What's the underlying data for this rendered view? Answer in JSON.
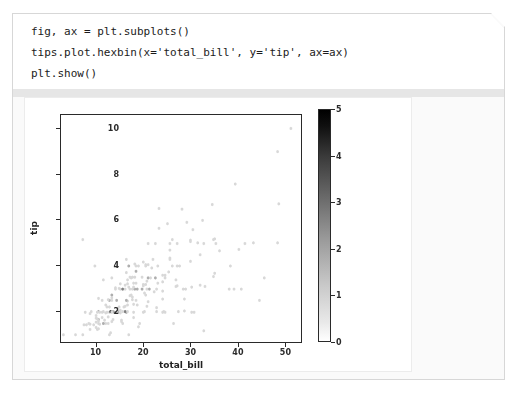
{
  "code_cell": {
    "lines": [
      "fig, ax = plt.subplots()",
      "tips.plot.hexbin(x='total_bill', y='tip', ax=ax)",
      "plt.show()"
    ]
  },
  "chart_data": {
    "type": "heatmap",
    "subtype": "hexbin",
    "title": "",
    "xlabel": "total_bill",
    "ylabel": "tip",
    "xlim": [
      2.5,
      53.5
    ],
    "ylim": [
      0.6,
      10.6
    ],
    "xticks": [
      10,
      20,
      30,
      40,
      50
    ],
    "yticks": [
      2,
      4,
      6,
      8,
      10
    ],
    "grid": false,
    "colormap": "viridis-gray-reversed",
    "colorbar": {
      "label": "",
      "min": 0,
      "max": 5,
      "ticks": [
        0,
        1,
        2,
        3,
        4,
        5
      ],
      "low_color": "#ffffff",
      "high_color": "#000000",
      "position": "right"
    },
    "gridsize": 100,
    "note": "counts per hexagonal bin of the seaborn tips dataset",
    "points": [
      [
        16.99,
        1.01
      ],
      [
        10.34,
        1.66
      ],
      [
        21.01,
        3.5
      ],
      [
        23.68,
        3.31
      ],
      [
        24.59,
        3.61
      ],
      [
        25.29,
        4.71
      ],
      [
        8.77,
        2.0
      ],
      [
        26.88,
        3.12
      ],
      [
        15.04,
        1.96
      ],
      [
        14.78,
        3.23
      ],
      [
        10.27,
        1.71
      ],
      [
        35.26,
        5.0
      ],
      [
        15.42,
        1.57
      ],
      [
        18.43,
        3.0
      ],
      [
        14.83,
        3.02
      ],
      [
        21.58,
        3.92
      ],
      [
        10.33,
        1.67
      ],
      [
        16.29,
        3.71
      ],
      [
        16.97,
        3.5
      ],
      [
        20.65,
        3.35
      ],
      [
        17.92,
        4.08
      ],
      [
        20.29,
        2.75
      ],
      [
        15.77,
        2.23
      ],
      [
        39.42,
        7.58
      ],
      [
        19.82,
        3.18
      ],
      [
        17.81,
        2.34
      ],
      [
        13.37,
        2.0
      ],
      [
        12.69,
        2.0
      ],
      [
        21.7,
        4.3
      ],
      [
        19.65,
        3.0
      ],
      [
        9.55,
        1.45
      ],
      [
        18.35,
        2.5
      ],
      [
        15.06,
        3.0
      ],
      [
        20.69,
        2.45
      ],
      [
        17.78,
        3.27
      ],
      [
        24.06,
        3.6
      ],
      [
        16.31,
        2.0
      ],
      [
        16.93,
        3.07
      ],
      [
        18.69,
        2.31
      ],
      [
        31.27,
        5.0
      ],
      [
        16.04,
        2.24
      ],
      [
        17.46,
        2.54
      ],
      [
        13.94,
        3.06
      ],
      [
        9.68,
        1.32
      ],
      [
        30.4,
        5.6
      ],
      [
        18.29,
        3.0
      ],
      [
        22.23,
        5.0
      ],
      [
        32.4,
        6.0
      ],
      [
        28.55,
        2.05
      ],
      [
        18.04,
        3.0
      ],
      [
        12.54,
        2.5
      ],
      [
        10.29,
        2.6
      ],
      [
        34.81,
        5.2
      ],
      [
        9.94,
        1.56
      ],
      [
        25.56,
        4.34
      ],
      [
        19.49,
        3.51
      ],
      [
        38.01,
        3.0
      ],
      [
        26.41,
        1.5
      ],
      [
        11.24,
        1.76
      ],
      [
        48.27,
        6.73
      ],
      [
        20.29,
        3.21
      ],
      [
        13.81,
        2.0
      ],
      [
        11.02,
        1.98
      ],
      [
        18.29,
        3.76
      ],
      [
        17.59,
        2.64
      ],
      [
        20.08,
        3.15
      ],
      [
        16.45,
        2.47
      ],
      [
        3.07,
        1.0
      ],
      [
        20.23,
        2.01
      ],
      [
        15.01,
        2.09
      ],
      [
        12.02,
        1.97
      ],
      [
        17.07,
        3.0
      ],
      [
        26.86,
        3.14
      ],
      [
        25.28,
        5.0
      ],
      [
        14.73,
        2.2
      ],
      [
        10.51,
        1.25
      ],
      [
        17.92,
        3.08
      ],
      [
        27.2,
        4.0
      ],
      [
        22.76,
        3.0
      ],
      [
        17.29,
        2.71
      ],
      [
        19.44,
        3.0
      ],
      [
        16.66,
        3.4
      ],
      [
        10.07,
        1.83
      ],
      [
        32.68,
        5.0
      ],
      [
        15.98,
        2.03
      ],
      [
        34.83,
        5.17
      ],
      [
        13.03,
        2.0
      ],
      [
        18.28,
        4.0
      ],
      [
        24.71,
        5.85
      ],
      [
        21.16,
        3.0
      ],
      [
        28.97,
        3.0
      ],
      [
        22.49,
        3.5
      ],
      [
        5.75,
        1.0
      ],
      [
        16.32,
        4.3
      ],
      [
        22.75,
        3.25
      ],
      [
        40.17,
        4.73
      ],
      [
        27.28,
        4.0
      ],
      [
        12.03,
        1.5
      ],
      [
        21.01,
        3.0
      ],
      [
        12.46,
        1.5
      ],
      [
        11.35,
        2.5
      ],
      [
        15.38,
        3.0
      ],
      [
        44.3,
        2.5
      ],
      [
        22.42,
        3.48
      ],
      [
        20.92,
        4.08
      ],
      [
        15.36,
        1.64
      ],
      [
        20.49,
        4.06
      ],
      [
        25.21,
        4.29
      ],
      [
        18.24,
        3.76
      ],
      [
        14.31,
        4.0
      ],
      [
        14.0,
        3.0
      ],
      [
        7.25,
        1.0
      ],
      [
        38.07,
        4.0
      ],
      [
        23.95,
        2.55
      ],
      [
        25.71,
        4.0
      ],
      [
        17.31,
        3.5
      ],
      [
        29.93,
        5.07
      ],
      [
        10.65,
        1.5
      ],
      [
        12.43,
        1.8
      ],
      [
        24.08,
        2.92
      ],
      [
        11.69,
        2.31
      ],
      [
        13.42,
        1.68
      ],
      [
        14.26,
        2.5
      ],
      [
        15.95,
        2.0
      ],
      [
        12.48,
        2.52
      ],
      [
        29.8,
        4.2
      ],
      [
        8.52,
        1.48
      ],
      [
        14.52,
        2.0
      ],
      [
        11.38,
        2.0
      ],
      [
        22.82,
        2.18
      ],
      [
        19.08,
        1.5
      ],
      [
        20.27,
        2.83
      ],
      [
        11.17,
        1.5
      ],
      [
        12.26,
        2.0
      ],
      [
        18.26,
        3.25
      ],
      [
        8.51,
        1.25
      ],
      [
        10.33,
        2.0
      ],
      [
        14.15,
        2.0
      ],
      [
        16.0,
        2.0
      ],
      [
        13.16,
        2.75
      ],
      [
        17.47,
        3.5
      ],
      [
        34.3,
        6.7
      ],
      [
        41.19,
        5.0
      ],
      [
        27.05,
        5.0
      ],
      [
        16.43,
        2.3
      ],
      [
        8.35,
        1.5
      ],
      [
        18.64,
        1.36
      ],
      [
        11.87,
        1.63
      ],
      [
        9.78,
        1.73
      ],
      [
        7.51,
        2.0
      ],
      [
        14.07,
        2.5
      ],
      [
        13.13,
        2.0
      ],
      [
        17.26,
        2.74
      ],
      [
        24.55,
        2.0
      ],
      [
        19.77,
        2.0
      ],
      [
        29.85,
        5.14
      ],
      [
        48.17,
        5.0
      ],
      [
        25.0,
        3.75
      ],
      [
        13.39,
        2.61
      ],
      [
        16.49,
        2.0
      ],
      [
        21.5,
        3.5
      ],
      [
        12.66,
        2.5
      ],
      [
        16.21,
        2.0
      ],
      [
        13.81,
        2.0
      ],
      [
        17.51,
        3.0
      ],
      [
        24.52,
        3.48
      ],
      [
        20.76,
        2.24
      ],
      [
        31.71,
        4.5
      ],
      [
        10.59,
        1.61
      ],
      [
        10.63,
        2.0
      ],
      [
        50.81,
        10.0
      ],
      [
        15.81,
        3.16
      ],
      [
        7.25,
        5.15
      ],
      [
        31.85,
        3.18
      ],
      [
        16.82,
        4.0
      ],
      [
        32.9,
        3.11
      ],
      [
        17.89,
        2.0
      ],
      [
        14.48,
        2.0
      ],
      [
        9.6,
        4.0
      ],
      [
        34.63,
        3.55
      ],
      [
        34.65,
        3.68
      ],
      [
        23.33,
        5.65
      ],
      [
        45.35,
        3.5
      ],
      [
        23.17,
        6.5
      ],
      [
        40.55,
        3.0
      ],
      [
        20.69,
        5.0
      ],
      [
        20.9,
        3.5
      ],
      [
        30.46,
        2.0
      ],
      [
        18.15,
        3.5
      ],
      [
        23.1,
        4.0
      ],
      [
        15.69,
        3.0
      ],
      [
        19.81,
        4.19
      ],
      [
        28.44,
        2.56
      ],
      [
        15.48,
        2.02
      ],
      [
        16.58,
        4.0
      ],
      [
        7.56,
        1.44
      ],
      [
        10.34,
        2.0
      ],
      [
        43.11,
        5.0
      ],
      [
        13.0,
        2.0
      ],
      [
        13.51,
        2.0
      ],
      [
        18.71,
        4.0
      ],
      [
        12.74,
        2.01
      ],
      [
        13.0,
        2.0
      ],
      [
        16.4,
        2.5
      ],
      [
        20.53,
        4.0
      ],
      [
        16.47,
        3.23
      ],
      [
        26.59,
        3.41
      ],
      [
        38.73,
        3.0
      ],
      [
        24.27,
        2.03
      ],
      [
        12.76,
        2.23
      ],
      [
        30.06,
        2.0
      ],
      [
        25.89,
        5.16
      ],
      [
        48.33,
        9.0
      ],
      [
        13.27,
        2.5
      ],
      [
        28.17,
        6.5
      ],
      [
        12.9,
        1.1
      ],
      [
        28.15,
        3.0
      ],
      [
        11.59,
        1.5
      ],
      [
        7.74,
        1.44
      ],
      [
        30.14,
        3.09
      ],
      [
        12.16,
        2.2
      ],
      [
        13.42,
        3.48
      ],
      [
        8.58,
        1.92
      ],
      [
        15.98,
        3.0
      ],
      [
        13.42,
        1.58
      ],
      [
        16.27,
        2.5
      ],
      [
        10.09,
        2.0
      ],
      [
        20.45,
        3.0
      ],
      [
        13.28,
        2.72
      ],
      [
        22.12,
        2.88
      ],
      [
        24.01,
        2.0
      ],
      [
        15.69,
        1.5
      ],
      [
        11.61,
        3.39
      ],
      [
        10.77,
        1.47
      ],
      [
        15.53,
        3.0
      ],
      [
        10.07,
        1.25
      ],
      [
        12.6,
        1.0
      ],
      [
        32.83,
        1.17
      ],
      [
        35.83,
        4.67
      ],
      [
        29.03,
        5.92
      ],
      [
        27.18,
        2.0
      ],
      [
        22.67,
        2.0
      ],
      [
        17.82,
        1.75
      ],
      [
        18.78,
        3.0
      ]
    ]
  },
  "axis": {
    "x_tick_labels": [
      "10",
      "20",
      "30",
      "40",
      "50"
    ],
    "y_tick_labels": [
      "2",
      "4",
      "6",
      "8",
      "10"
    ],
    "xlabel": "total_bill",
    "ylabel": "tip"
  },
  "colorbar_labels": [
    "0",
    "1",
    "2",
    "3",
    "4",
    "5"
  ]
}
